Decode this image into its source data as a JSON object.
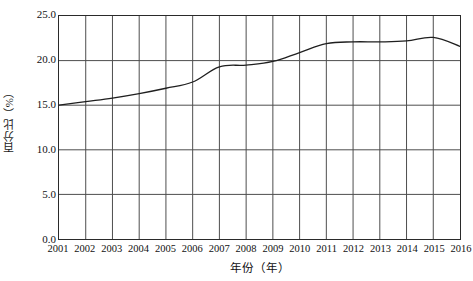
{
  "chart_data": {
    "type": "line",
    "title": "",
    "xlabel": "年份（年）",
    "ylabel": "百分比（%）",
    "x": [
      2001,
      2002,
      2003,
      2004,
      2005,
      2006,
      2007,
      2008,
      2009,
      2010,
      2011,
      2012,
      2013,
      2014,
      2015,
      2016
    ],
    "categories": [
      "2001",
      "2002",
      "2003",
      "2004",
      "2005",
      "2006",
      "2007",
      "2008",
      "2009",
      "2010",
      "2011",
      "2012",
      "2013",
      "2014",
      "2015",
      "2016"
    ],
    "series": [
      {
        "name": "百分比",
        "values": [
          15.0,
          15.4,
          15.8,
          16.3,
          16.9,
          17.6,
          19.3,
          19.5,
          19.9,
          20.9,
          21.9,
          22.1,
          22.1,
          22.2,
          22.6,
          21.6
        ]
      }
    ],
    "xlim": [
      2001,
      2016
    ],
    "ylim": [
      0.0,
      25.0
    ],
    "yticks": [
      "0.0",
      "5.0",
      "10.0",
      "15.0",
      "20.0",
      "25.0"
    ],
    "ytick_values": [
      0.0,
      5.0,
      10.0,
      15.0,
      20.0,
      25.0
    ],
    "grid": "both",
    "legend": "none",
    "line_color": "#1f1f1f",
    "grid_color": "#4d4d4d",
    "axis_color": "#2a2a2a",
    "background_color": "#ffffff"
  },
  "axes": {
    "y_title": "百分比（%）",
    "x_title": "年份（年）"
  }
}
